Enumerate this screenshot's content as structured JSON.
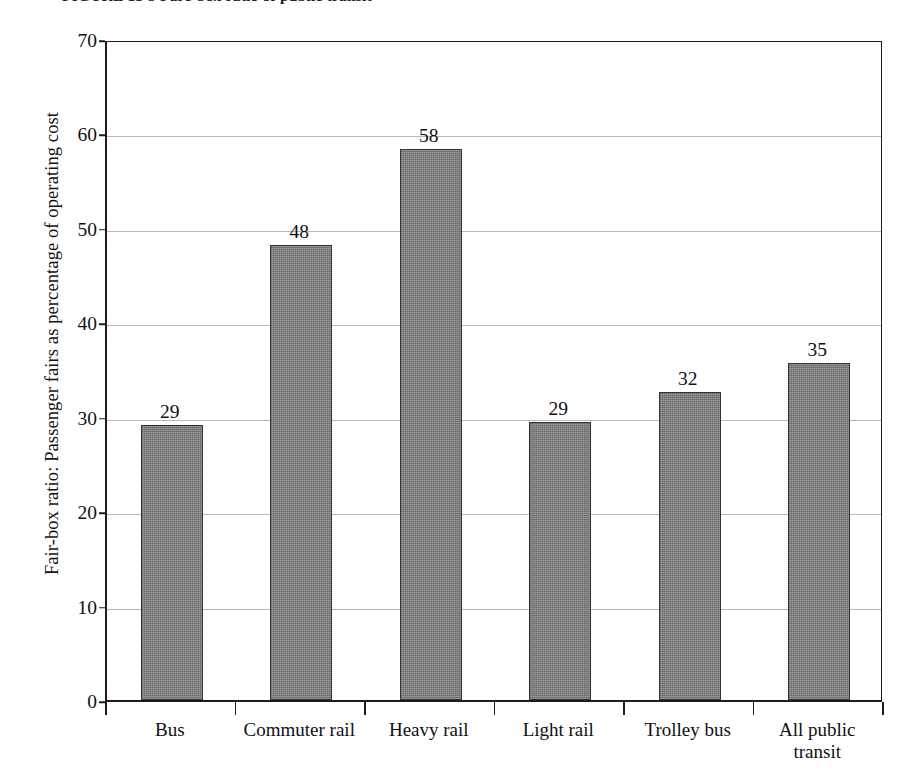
{
  "figure": {
    "caption_prefix": "FIGURE 11-3",
    "caption_text": "Fare-box ratio, 1998",
    "caption_full": "FIGURE 11-3  Fare-box ratio of public transit"
  },
  "chart_data": {
    "type": "bar",
    "title": "",
    "xlabel": "",
    "ylabel": "Fair-box ratio: Passenger fairs as percentage of operating cost",
    "ylim": [
      0,
      70
    ],
    "yticks": [
      0,
      10,
      20,
      30,
      40,
      50,
      60,
      70
    ],
    "ytick_labels": [
      "0",
      "10",
      "20",
      "30",
      "40",
      "50",
      "60",
      "70"
    ],
    "grid": true,
    "legend": null,
    "categories": [
      "Bus",
      "Commuter rail",
      "Heavy rail",
      "Light rail",
      "Trolley bus",
      "All public transit"
    ],
    "category_lines": [
      [
        "Bus"
      ],
      [
        "Commuter rail"
      ],
      [
        "Heavy rail"
      ],
      [
        "Light rail"
      ],
      [
        "Trolley bus"
      ],
      [
        "All public",
        "transit"
      ]
    ],
    "values": [
      29,
      48,
      58,
      29,
      32,
      35
    ],
    "bar_plot_values": [
      29.1,
      48.2,
      58.3,
      29.4,
      32.6,
      35.7
    ],
    "data_labels": [
      "29",
      "48",
      "58",
      "29",
      "32",
      "35"
    ],
    "bar_color": "#7c7c7c",
    "bar_edge_color": "#333333",
    "gridline_color": "#b9b9b9",
    "axis_color": "#1d1d1d",
    "background": "#ffffff"
  }
}
